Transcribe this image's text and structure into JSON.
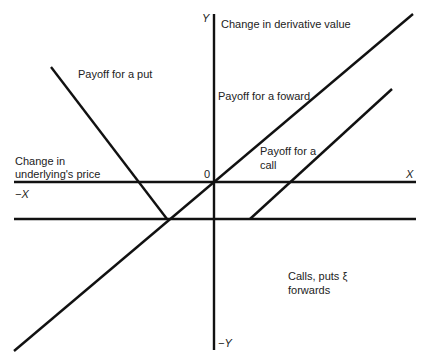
{
  "diagram": {
    "axes": {
      "y_positive_label": "Y",
      "y_negative_label": "−Y",
      "x_positive_label": "X",
      "x_negative_label": "−X",
      "origin_label": "0",
      "y_axis_title": "Change in derivative value",
      "x_axis_title_line1": "Change in",
      "x_axis_title_line2": "underlying's price"
    },
    "annotations": {
      "put": "Payoff for a put",
      "forward": "Payoff for a foward",
      "call_line1": "Payoff for a",
      "call_line2": "call",
      "caption_line1": "Calls, puts ξ",
      "caption_line2": "forwards"
    },
    "lines": [
      {
        "name": "x-axis",
        "kind": "axis"
      },
      {
        "name": "y-axis",
        "kind": "axis"
      },
      {
        "name": "lower-reference-line",
        "kind": "reference"
      },
      {
        "name": "put-payoff-line",
        "kind": "payoff",
        "slope": "negative"
      },
      {
        "name": "forward-payoff-line",
        "kind": "payoff",
        "slope": "positive"
      },
      {
        "name": "call-payoff-line",
        "kind": "payoff",
        "slope": "positive"
      }
    ]
  }
}
